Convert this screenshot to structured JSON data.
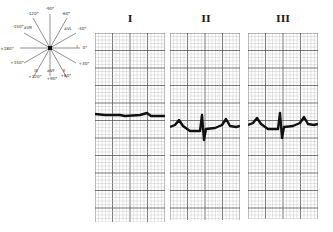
{
  "hexaxial": {
    "labels": [
      {
        "text": "-90°",
        "x": 50,
        "y": 10
      },
      {
        "text": "-120°",
        "x": 33,
        "y": 15
      },
      {
        "text": "-60°",
        "x": 66,
        "y": 15
      },
      {
        "text": "-150°",
        "x": 18,
        "y": 28
      },
      {
        "text": "aVR",
        "x": 28,
        "y": 29
      },
      {
        "text": "aVL",
        "x": 68,
        "y": 30
      },
      {
        "text": "-30°",
        "x": 82,
        "y": 30
      },
      {
        "text": "±180°",
        "x": 7,
        "y": 50
      },
      {
        "text": "I",
        "x": 77,
        "y": 48
      },
      {
        "text": "0°",
        "x": 85,
        "y": 49
      },
      {
        "text": "+150°",
        "x": 17,
        "y": 64
      },
      {
        "text": "+30°",
        "x": 84,
        "y": 65
      },
      {
        "text": "III",
        "x": 36,
        "y": 72
      },
      {
        "text": "aVF",
        "x": 51,
        "y": 72
      },
      {
        "text": "II",
        "x": 64,
        "y": 72
      },
      {
        "text": "+120°",
        "x": 35,
        "y": 78
      },
      {
        "text": "+90°",
        "x": 52,
        "y": 80
      },
      {
        "text": "+60°",
        "x": 66,
        "y": 77
      }
    ]
  },
  "leads": [
    {
      "label": "I",
      "x": 95,
      "width": 70,
      "height": 189,
      "baseline": 114,
      "trace": "flat"
    },
    {
      "label": "II",
      "x": 170,
      "width": 70,
      "height": 187,
      "baseline": 127,
      "trace": "biphasic"
    },
    {
      "label": "III",
      "x": 248,
      "width": 70,
      "height": 186,
      "baseline": 125,
      "trace": "biphasic"
    }
  ],
  "colors": {
    "grid_minor": "#bbbbbb",
    "grid_major": "#555555",
    "trace": "#111111",
    "text": "#222222"
  }
}
